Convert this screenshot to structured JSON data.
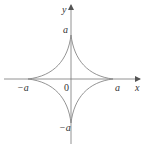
{
  "diagram": {
    "type": "curve-plot",
    "axes": {
      "x_label": "x",
      "y_label": "y",
      "origin_label": "0"
    },
    "ticks": {
      "x_positive": "a",
      "x_negative": "−a",
      "y_positive": "a",
      "y_negative": "−a"
    },
    "colors": {
      "curve": "#888888",
      "axes": "#777777",
      "text": "#333333"
    }
  }
}
